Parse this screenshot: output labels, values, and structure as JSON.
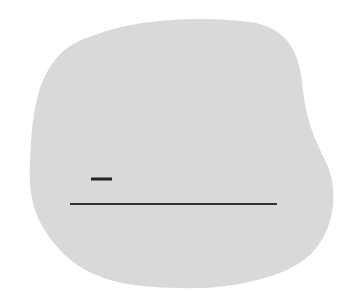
{
  "canvas": {
    "width": 356,
    "height": 291,
    "background": "#ffffff"
  },
  "blob": {
    "fill": "#d9d9d9",
    "path": "M 95 35 C 130 20, 200 15, 250 22 C 290 28, 300 55, 303 90 C 306 120, 315 140, 325 160 C 340 190, 335 230, 310 255 C 285 278, 230 290, 180 288 C 130 287, 90 282, 60 250 C 35 222, 28 200, 30 160 C 32 120, 35 85, 55 60 C 65 47, 78 40, 95 35 Z"
  },
  "short_dash": {
    "x1": 91,
    "y1": 179,
    "x2": 112,
    "y2": 179,
    "stroke": "#222222",
    "width": 3
  },
  "long_line": {
    "x1": 70,
    "y1": 204,
    "x2": 277,
    "y2": 204,
    "stroke": "#333333",
    "width": 2
  }
}
